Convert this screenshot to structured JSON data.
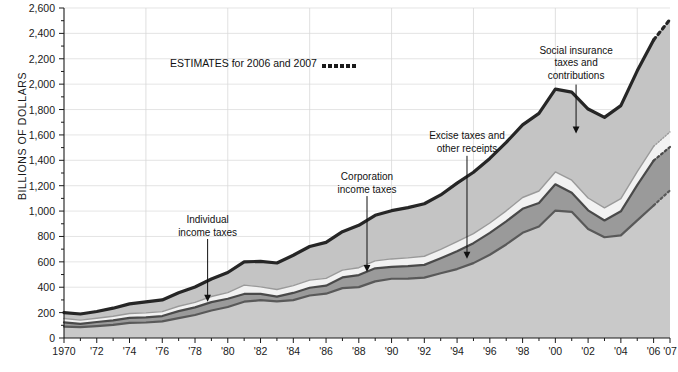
{
  "chart_data": {
    "type": "area",
    "stacked": true,
    "title": "",
    "xlabel": "",
    "ylabel": "BILLIONS OF DOLLARS",
    "ylim": [
      0,
      2600
    ],
    "ytick_step": 200,
    "yminor_step": 100,
    "grid": true,
    "gridlines_y": [
      1000,
      1400,
      1800,
      2200,
      2600,
      600,
      200
    ],
    "gridlines_x": [
      1975,
      1980,
      1985,
      1990,
      1995,
      2000,
      2005
    ],
    "ytick_labels": [
      "0",
      "200",
      "400",
      "600",
      "800",
      "1,000",
      "1,200",
      "1,400",
      "1,600",
      "1,800",
      "2,000",
      "2,200",
      "2,400",
      "2,600"
    ],
    "x": [
      1970,
      1971,
      1972,
      1973,
      1974,
      1975,
      1976,
      1977,
      1978,
      1979,
      1980,
      1981,
      1982,
      1983,
      1984,
      1985,
      1986,
      1987,
      1988,
      1989,
      1990,
      1991,
      1992,
      1993,
      1994,
      1995,
      1996,
      1997,
      1998,
      1999,
      2000,
      2001,
      2002,
      2003,
      2004,
      2005,
      2006,
      2007
    ],
    "xtick_values": [
      1970,
      1972,
      1974,
      1976,
      1978,
      1980,
      1982,
      1984,
      1986,
      1988,
      1990,
      1992,
      1994,
      1996,
      1998,
      2000,
      2002,
      2004,
      2006,
      2007
    ],
    "xtick_labels": [
      "1970",
      "'72",
      "'74",
      "'76",
      "'78",
      "'80",
      "'82",
      "'84",
      "'86",
      "'88",
      "'90",
      "'92",
      "'94",
      "'96",
      "'98",
      "'00",
      "'02",
      "'04",
      "'06",
      "'07"
    ],
    "estimate_years": [
      2006,
      2007
    ],
    "series": [
      {
        "name": "Individual income taxes",
        "key": "individual",
        "color": "#c9c9c9",
        "line_color": "#595959",
        "values": [
          90,
          86,
          94,
          103,
          119,
          122,
          131,
          157,
          181,
          217,
          244,
          286,
          298,
          289,
          298,
          335,
          349,
          393,
          401,
          446,
          467,
          468,
          476,
          510,
          543,
          590,
          656,
          737,
          829,
          879,
          1004,
          994,
          858,
          794,
          809,
          927,
          1044,
          1163
        ]
      },
      {
        "name": "Corporation income taxes",
        "key": "corporation",
        "color": "#9a9a9a",
        "line_color": "#4a4a4a",
        "values": [
          33,
          26,
          32,
          36,
          39,
          41,
          42,
          55,
          60,
          66,
          65,
          61,
          49,
          37,
          57,
          61,
          63,
          84,
          95,
          103,
          94,
          98,
          100,
          118,
          140,
          157,
          172,
          182,
          189,
          185,
          207,
          151,
          148,
          132,
          189,
          278,
          354,
          342
        ]
      },
      {
        "name": "Excise taxes and other receipts",
        "key": "excise_other",
        "color": "#f2f2f2",
        "line_color": "#9a9a9a",
        "values": [
          31,
          29,
          30,
          32,
          35,
          35,
          35,
          38,
          40,
          44,
          49,
          70,
          56,
          56,
          58,
          60,
          58,
          58,
          58,
          59,
          62,
          65,
          68,
          71,
          76,
          75,
          78,
          83,
          89,
          94,
          97,
          98,
          97,
          99,
          100,
          106,
          112,
          119
        ]
      },
      {
        "name": "Social insurance taxes and contributions",
        "key": "social_insurance",
        "color": "#c4c4c4",
        "line_color": "#262626",
        "values": [
          46,
          48,
          53,
          64,
          76,
          86,
          92,
          106,
          121,
          138,
          158,
          183,
          201,
          209,
          239,
          265,
          283,
          303,
          334,
          359,
          380,
          396,
          414,
          428,
          461,
          484,
          509,
          539,
          572,
          612,
          653,
          694,
          701,
          713,
          733,
          794,
          838,
          886
        ]
      }
    ],
    "totals": [
      200,
      189,
      209,
      235,
      269,
      284,
      300,
      356,
      402,
      465,
      516,
      600,
      604,
      591,
      652,
      721,
      753,
      838,
      888,
      967,
      1003,
      1027,
      1058,
      1127,
      1220,
      1306,
      1415,
      1541,
      1679,
      1770,
      1961,
      1937,
      1804,
      1738,
      1831,
      2105,
      2348,
      2510
    ],
    "annotations": [
      {
        "key": "individual",
        "text": "Individual\nincome taxes",
        "label_x": 0.237,
        "label_y": 0.625,
        "arrow_from_y": 0.7,
        "arrow_to_y": 0.89
      },
      {
        "key": "corporation",
        "text": "Corporation\nincome taxes",
        "label_x": 0.5,
        "label_y": 0.495,
        "arrow_from_y": 0.57,
        "arrow_to_y": 0.8
      },
      {
        "key": "excise_other",
        "text": "Excise taxes and\nother receipts",
        "label_x": 0.665,
        "label_y": 0.37,
        "arrow_from_y": 0.448,
        "arrow_to_y": 0.76
      },
      {
        "key": "social_insurance",
        "text": "Social insurance\ntaxes and\ncontributions",
        "label_x": 0.845,
        "label_y": 0.112,
        "arrow_from_y": 0.232,
        "arrow_to_y": 0.38
      }
    ]
  },
  "legend": {
    "estimates_text": "ESTIMATES for 2006 and 2007",
    "dot_count": 6,
    "dot_color": "#1a1a1a"
  },
  "axis": {
    "ylabel": "BILLIONS OF DOLLARS",
    "axis_color": "#1a1a1a",
    "grid_color": "#d8d8d8"
  }
}
